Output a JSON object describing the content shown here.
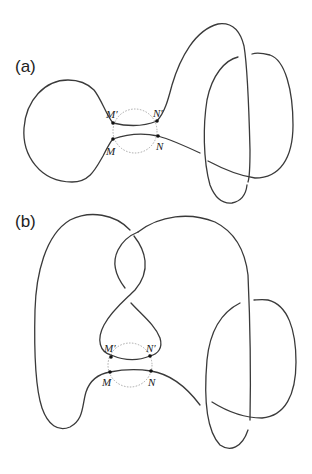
{
  "figure": {
    "panels": [
      {
        "id": "a",
        "label": "(a)",
        "points": {
          "M_prime": "M′",
          "N_prime": "N′",
          "M": "M",
          "N": "N"
        }
      },
      {
        "id": "b",
        "label": "(b)",
        "points": {
          "M_prime": "M′",
          "N_prime": "N′",
          "M": "M",
          "N": "N"
        }
      }
    ],
    "colors": {
      "strand": "#3a3a3a",
      "dashed_circle": "#a8a8a8",
      "points": "#111111"
    }
  }
}
